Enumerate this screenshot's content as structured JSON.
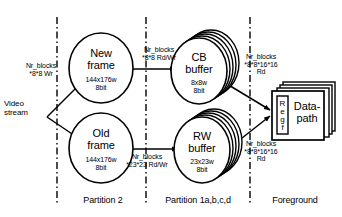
{
  "diagram": {
    "background_color": "#ffffff",
    "stroke_color": "#000000",
    "nodes": [
      {
        "id": "new_frame",
        "shape": "ellipse",
        "title": "New\nframe",
        "sub": "144x176w\n8bit",
        "stacked": false
      },
      {
        "id": "old_frame",
        "shape": "ellipse",
        "title": "Old\nframe",
        "sub": "144x176w\n8bit",
        "stacked": false
      },
      {
        "id": "cb_buffer",
        "shape": "ellipse-stack",
        "title": "CB\nbuffer",
        "sub": "8x8w\n8bit",
        "stacked": true
      },
      {
        "id": "rw_buffer",
        "shape": "ellipse-stack",
        "title": "RW\nbuffer",
        "sub": "23x23w\n8bit",
        "stacked": true
      },
      {
        "id": "datapath",
        "shape": "box-stack",
        "title": "Data-\npath",
        "regfile": "Regf",
        "stacked": true
      }
    ],
    "edge_labels": [
      {
        "id": "in_new",
        "text": "Nr_blocks\n*8*8 Wr"
      },
      {
        "id": "new_to_cb",
        "text": "Nr_blocks\n*8*8 Rd/Wr"
      },
      {
        "id": "old_to_rw",
        "text": "Nr_blocks\n*23*23 Rd/Wr"
      },
      {
        "id": "cb_to_dp",
        "text": "Nr_blocks\n*8*8*16*16\nRd"
      },
      {
        "id": "rw_to_dp",
        "text": "Nr_blocks\n*8*8*16*16\nRd"
      }
    ],
    "stream_label": "Video\nstream",
    "partitions": [
      {
        "id": "partition2",
        "label": "Partition 2"
      },
      {
        "id": "partition1",
        "label": "Partition 1a,b,c,d"
      },
      {
        "id": "foreground",
        "label": "Foreground"
      }
    ]
  }
}
